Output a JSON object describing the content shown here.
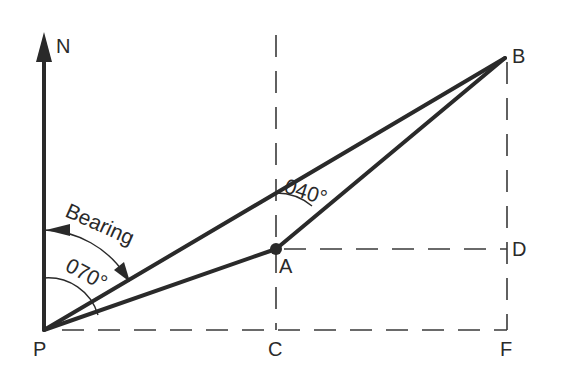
{
  "diagram": {
    "type": "bearing-diagram",
    "points": {
      "N": {
        "label": "N"
      },
      "P": {
        "label": "P"
      },
      "A": {
        "label": "A"
      },
      "B": {
        "label": "B"
      },
      "C": {
        "label": "C"
      },
      "D": {
        "label": "D"
      },
      "F": {
        "label": "F"
      }
    },
    "annotations": {
      "bearing_label": "Bearing",
      "angle_P": "070°",
      "angle_A": "040°"
    },
    "colors": {
      "line": "#2a2a2a",
      "background": "#ffffff"
    }
  }
}
